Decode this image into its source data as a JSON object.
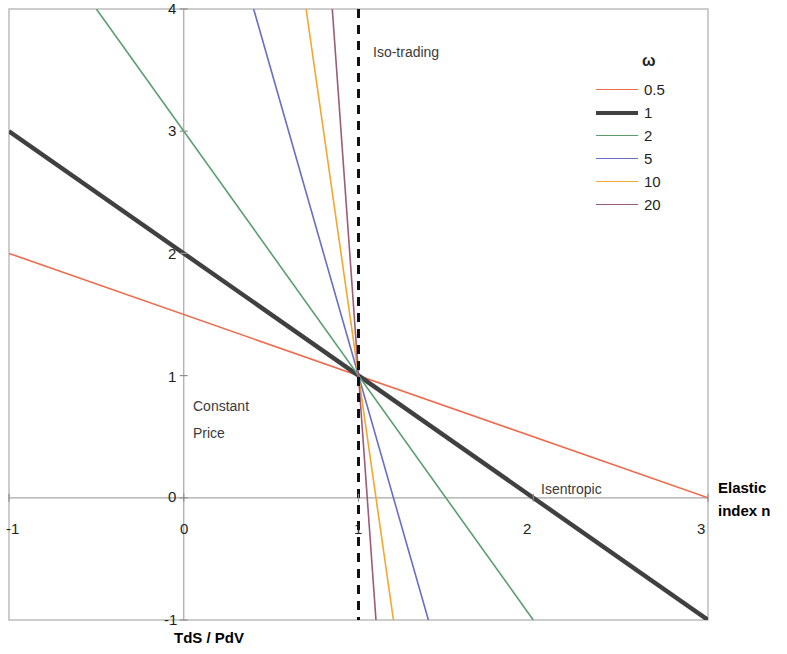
{
  "chart_data": {
    "type": "line",
    "title": "",
    "xlabel": "Elastic index n",
    "ylabel": "TdS / PdV",
    "xlim": [
      -1,
      3
    ],
    "ylim": [
      -1,
      4
    ],
    "xticks": [
      "-1",
      "0",
      "1",
      "2",
      "3"
    ],
    "yticks": [
      "-1",
      "0",
      "1",
      "2",
      "3",
      "4"
    ],
    "grid": false,
    "legend_position": "top-right",
    "legend_title": "ω",
    "series": [
      {
        "name": "0.5",
        "omega": 0.5,
        "color": "#ef6a4c",
        "width": 1.6,
        "points": [
          [
            -1,
            2.0
          ],
          [
            3,
            0.0
          ]
        ]
      },
      {
        "name": "1",
        "omega": 1,
        "color": "#404040",
        "width": 4.4,
        "points": [
          [
            -1,
            3.0
          ],
          [
            3,
            -1.0
          ]
        ]
      },
      {
        "name": "2",
        "omega": 2,
        "color": "#5a9e6f",
        "width": 1.6,
        "points": [
          [
            -0.5,
            4.0
          ],
          [
            2.0,
            -1.0
          ]
        ]
      },
      {
        "name": "5",
        "omega": 5,
        "color": "#6a6ec2",
        "width": 1.6,
        "points": [
          [
            0.4,
            4.0
          ],
          [
            1.4,
            -1.0
          ]
        ]
      },
      {
        "name": "10",
        "omega": 10,
        "color": "#f0a830",
        "width": 1.6,
        "points": [
          [
            0.7,
            4.0
          ],
          [
            1.2,
            -1.0
          ]
        ]
      },
      {
        "name": "20",
        "omega": 20,
        "color": "#9b5c7a",
        "width": 1.6,
        "points": [
          [
            0.85,
            4.0
          ],
          [
            1.1,
            -1.0
          ]
        ]
      }
    ],
    "reference_lines": [
      {
        "name": "iso-trading",
        "type": "vertical",
        "x": 1,
        "style": "dashed",
        "color": "#111111",
        "width": 3
      }
    ],
    "annotations": [
      {
        "name": "iso-trading",
        "text": "Iso-trading",
        "x": 1.07,
        "y": 3.7
      },
      {
        "name": "constant-price",
        "text": "Constant",
        "x": -0.1,
        "y": 0.82
      },
      {
        "name": "constant-price-2",
        "text": "Price",
        "x": -0.1,
        "y": 0.62
      },
      {
        "name": "isentropic",
        "text": "Isentropic",
        "x": 2.1,
        "y": 0.12
      }
    ]
  },
  "axes": {
    "x_title_line1": "Elastic",
    "x_title_line2": "index n",
    "y_title": "TdS / PdV",
    "x_tick_labels": [
      "-1",
      "0",
      "1",
      "2",
      "3"
    ],
    "y_tick_labels": [
      "4",
      "3",
      "2",
      "1",
      "0",
      "-1"
    ]
  },
  "legend": {
    "title": "ω",
    "items": [
      {
        "label": "0.5",
        "color": "#ef6a4c",
        "thickness": "1.6px"
      },
      {
        "label": "1",
        "color": "#404040",
        "thickness": "4.4px"
      },
      {
        "label": "2",
        "color": "#5a9e6f",
        "thickness": "1.6px"
      },
      {
        "label": "5",
        "color": "#6a6ec2",
        "thickness": "1.6px"
      },
      {
        "label": "10",
        "color": "#f0a830",
        "thickness": "1.6px"
      },
      {
        "label": "20",
        "color": "#9b5c7a",
        "thickness": "1.6px"
      }
    ]
  },
  "annotations": {
    "iso_trading": "Iso-trading",
    "constant_price_line1": "Constant",
    "constant_price_line2": "Price",
    "isentropic": "Isentropic"
  }
}
